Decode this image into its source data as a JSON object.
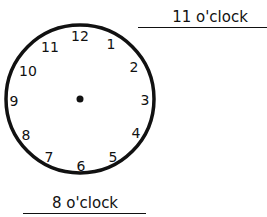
{
  "clock": {
    "numbers": [
      "12",
      "1",
      "2",
      "3",
      "4",
      "5",
      "6",
      "7",
      "8",
      "9",
      "10",
      "11"
    ],
    "hands": "none",
    "center_dot": true
  },
  "answers": {
    "top_label": "11 o'clock",
    "bottom_label": "8 o'clock"
  }
}
